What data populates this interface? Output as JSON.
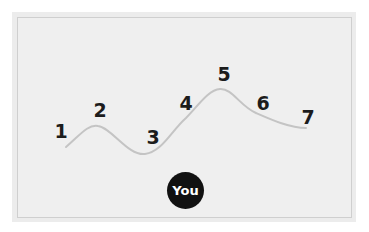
{
  "steps": [
    {
      "label": "1",
      "x": 61,
      "y": 131
    },
    {
      "label": "2",
      "x": 100,
      "y": 110
    },
    {
      "label": "3",
      "x": 153,
      "y": 137
    },
    {
      "label": "4",
      "x": 186,
      "y": 103
    },
    {
      "label": "5",
      "x": 224,
      "y": 74
    },
    {
      "label": "6",
      "x": 263,
      "y": 103
    },
    {
      "label": "7",
      "x": 308,
      "y": 117
    }
  ],
  "marker": {
    "label": "You"
  },
  "colors": {
    "path": "#c4c4c4",
    "text": "#1c1c1c",
    "marker_bg": "#111111",
    "marker_text": "#ffffff"
  }
}
